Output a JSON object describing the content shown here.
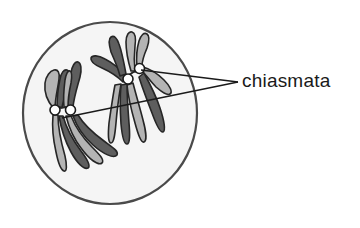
{
  "figure": {
    "kind": "biology-diagram",
    "background_color": "#ffffff"
  },
  "cell": {
    "name": "cell-outline",
    "center_x": 110,
    "center_y": 113,
    "radius_x": 87,
    "radius_y": 91,
    "fill_color": "#f5f5f5",
    "stroke_color": "#4a4a4a",
    "stroke_width": 2.2
  },
  "chromosome_style": {
    "outline_color": "#262626",
    "dark_fill": "#5e5e5e",
    "light_fill": "#b4b4b4",
    "arm_width": 6.5
  },
  "bivalents": [
    {
      "name": "bivalent-left",
      "label": "left homologous pair",
      "chiasma_count": 2
    },
    {
      "name": "bivalent-right",
      "label": "right homologous pair",
      "chiasma_count": 2
    }
  ],
  "chiasmata": {
    "marker_fill": "#ffffff",
    "marker_stroke": "#1a1a1a",
    "marker_radius": 5.0,
    "points": [
      {
        "name": "chiasma-left-outer",
        "x": 55,
        "y": 110
      },
      {
        "name": "chiasma-left-inner",
        "x": 70.5,
        "y": 110
      },
      {
        "name": "chiasma-right-lower",
        "x": 128,
        "y": 79
      },
      {
        "name": "chiasma-right-upper",
        "x": 139.5,
        "y": 68.5
      }
    ]
  },
  "annotation": {
    "label": "chiasmata",
    "text_x": 242,
    "text_y": 87,
    "font_size": 19,
    "color": "#1a1a1a",
    "leader_color": "#1a1a1a",
    "leader_width": 1.4,
    "converge_x": 238,
    "converge_y": 82,
    "leader_lines": [
      {
        "name": "leader-to-right-pair",
        "x1": 238,
        "y1": 82,
        "x2": 141,
        "y2": 70
      },
      {
        "name": "leader-to-left-pair",
        "x1": 238,
        "y1": 82,
        "x2": 62,
        "y2": 118
      }
    ]
  }
}
